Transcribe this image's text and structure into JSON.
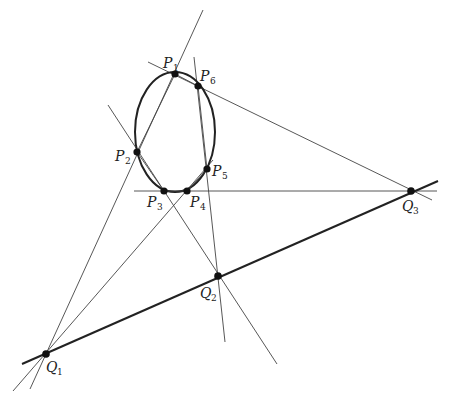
{
  "figure": {
    "conic": {
      "type": "ellipse"
    },
    "points": [
      {
        "id": "P1",
        "label": "P",
        "sub": "1"
      },
      {
        "id": "P2",
        "label": "P",
        "sub": "2"
      },
      {
        "id": "P3",
        "label": "P",
        "sub": "3"
      },
      {
        "id": "P4",
        "label": "P",
        "sub": "4"
      },
      {
        "id": "P5",
        "label": "P",
        "sub": "5"
      },
      {
        "id": "P6",
        "label": "P",
        "sub": "6"
      },
      {
        "id": "Q1",
        "label": "Q",
        "sub": "1"
      },
      {
        "id": "Q2",
        "label": "Q",
        "sub": "2"
      },
      {
        "id": "Q3",
        "label": "Q",
        "sub": "3"
      }
    ],
    "hexagon_sides": [
      "P1P2",
      "P2P3",
      "P3P4",
      "P4P5",
      "P5P6",
      "P6P1"
    ],
    "extended_lines": [
      {
        "through": [
          "P1",
          "P2"
        ],
        "meets_at": "Q1"
      },
      {
        "through": [
          "P4",
          "P5"
        ],
        "meets_at": "Q1"
      },
      {
        "through": [
          "P2",
          "P3"
        ],
        "meets_at": "Q2"
      },
      {
        "through": [
          "P5",
          "P6"
        ],
        "meets_at": "Q2"
      },
      {
        "through": [
          "P6",
          "P1"
        ],
        "meets_at": "Q3"
      },
      {
        "through": [
          "P3",
          "P4"
        ],
        "meets_at": "Q3"
      }
    ],
    "pascal_line": {
      "through": [
        "Q1",
        "Q2",
        "Q3"
      ]
    }
  }
}
